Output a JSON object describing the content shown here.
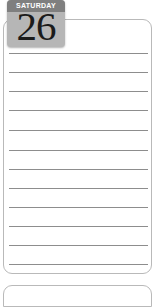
{
  "page": {
    "kind": "planner-day-page",
    "background_color": "#ffffff"
  },
  "day_card": {
    "border_color": "#b9b9b9",
    "background_color": "#ffffff",
    "rule_color": "#8d8d8d",
    "rule_count": 12,
    "rule_positions": [
      33,
      52,
      71,
      90,
      110,
      130,
      149,
      168,
      187,
      206,
      225,
      244
    ]
  },
  "date_tile": {
    "weekday": "SATURDAY",
    "day_number": "26",
    "header_color": "#7f7f7f",
    "body_color": "#b6b6b6",
    "weekday_text_color": "#ffffff",
    "number_text_color": "#1b1b1b"
  },
  "next_card": {
    "border_color": "#b9b9b9",
    "background_color": "#ffffff"
  }
}
